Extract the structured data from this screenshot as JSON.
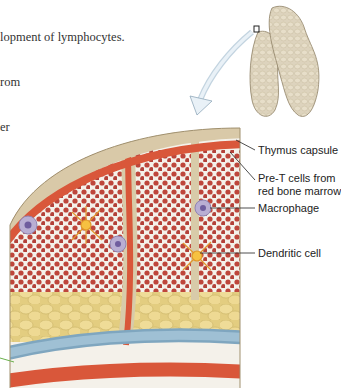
{
  "caption": {
    "lines": [
      "lopment of lymphocytes.",
      "rom",
      "er"
    ]
  },
  "labels": {
    "thymus_capsule": "Thymus capsule",
    "pre_t_cells_line1": "Pre-T cells from",
    "pre_t_cells_line2": "red bone marrow",
    "macrophage": "Macrophage",
    "dendritic_cell": "Dendritic cell"
  },
  "colors": {
    "capsule": "#d9c9a8",
    "artery": "#d9573a",
    "vein": "#8fb3c9",
    "rbc": "#b5281c",
    "fat": "#e8d48a",
    "thymus_organ": "#ddd3bd",
    "dendritic": "#f0b429",
    "macrophage": "#a89cc8"
  }
}
